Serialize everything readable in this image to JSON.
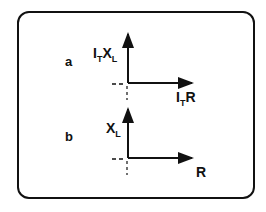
{
  "panels": [
    {
      "letter": "a",
      "y_label": "I",
      "y_label_sub1": "T",
      "y_label_mid": "X",
      "y_label_sub2": "L",
      "x_label": "I",
      "x_label_sub": "T",
      "x_label_end": "R"
    },
    {
      "letter": "b",
      "y_label": "X",
      "y_label_sub": "L",
      "x_label": "R"
    }
  ]
}
